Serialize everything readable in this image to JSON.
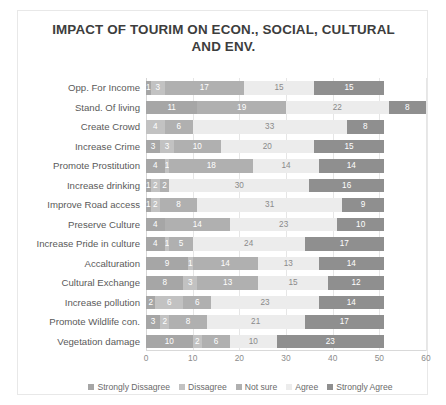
{
  "chart_data": {
    "type": "bar",
    "orientation": "horizontal",
    "stacked": true,
    "title": "IMPACT OF TOURIM ON ECON., SOCIAL, CULTURAL AND ENV.",
    "xlabel": "",
    "ylabel": "",
    "xlim": [
      0,
      60
    ],
    "xticks": [
      0,
      10,
      20,
      30,
      40,
      50,
      60
    ],
    "grid": true,
    "legend_position": "bottom",
    "categories": [
      "Opp. For Income",
      "Stand. Of living",
      "Create Crowd",
      "Increase Crime",
      "Promote Prostitution",
      "Increase drinking",
      "Improve Road access",
      "Preserve Culture",
      "Increase Pride in culture",
      "Accalturation",
      "Cultural Exchange",
      "Increase pollution",
      "Promote Wildlife con.",
      "Vegetation damage"
    ],
    "series": [
      {
        "name": "Strongly Dissagree",
        "color": "#a6a6a6",
        "values": [
          1,
          11,
          0,
          3,
          4,
          1,
          1,
          4,
          4,
          9,
          8,
          2,
          3,
          10
        ]
      },
      {
        "name": "Dissagree",
        "color": "#c2c2c2",
        "values": [
          3,
          0,
          4,
          3,
          1,
          2,
          2,
          0,
          1,
          1,
          3,
          6,
          2,
          2
        ]
      },
      {
        "name": "Not sure",
        "color": "#b0b0b0",
        "values": [
          17,
          19,
          6,
          10,
          18,
          2,
          8,
          14,
          5,
          14,
          13,
          6,
          8,
          6
        ]
      },
      {
        "name": "Agree",
        "color": "#ececec",
        "values": [
          15,
          22,
          33,
          20,
          14,
          30,
          31,
          23,
          24,
          13,
          15,
          23,
          21,
          10
        ]
      },
      {
        "name": "Strongly Agree",
        "color": "#8f8f8f",
        "values": [
          15,
          8,
          8,
          15,
          14,
          16,
          9,
          10,
          17,
          14,
          12,
          14,
          17,
          23
        ]
      }
    ],
    "totals": [
      51,
      60,
      51,
      51,
      51,
      51,
      51,
      51,
      51,
      51,
      51,
      51,
      51,
      51
    ]
  },
  "legend": {
    "items": [
      {
        "label": "Strongly Dissagree"
      },
      {
        "label": "Dissagree"
      },
      {
        "label": "Not sure"
      },
      {
        "label": "Agree"
      },
      {
        "label": "Strongly Agree"
      }
    ]
  }
}
